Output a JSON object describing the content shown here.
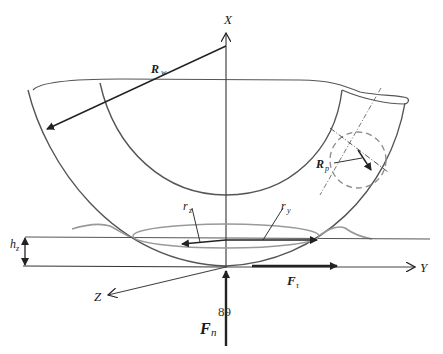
{
  "diagram": {
    "labels": {
      "x_axis": "X",
      "y_axis": "Y",
      "z_axis": "Z",
      "wheel_radius": "R",
      "wheel_radius_sub": "w",
      "profile_radius": "R",
      "profile_radius_sub": "p",
      "contact_radius_z": "r",
      "contact_radius_z_sub": "z",
      "contact_radius_y": "r",
      "contact_radius_y_sub": "y",
      "depth": "h",
      "depth_sub": "z",
      "tangential_force": "F",
      "tangential_force_sub": "τ",
      "normal_force": "F",
      "normal_force_sub": "n",
      "page_number": "89"
    },
    "colors": {
      "line": "#3a3a3a",
      "light_line": "#8a8a8a",
      "dashed": "#7a7a7a",
      "background": "#ffffff"
    }
  }
}
